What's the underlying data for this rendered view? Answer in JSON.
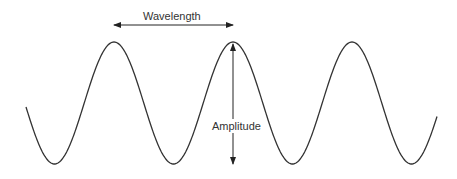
{
  "diagram": {
    "labels": {
      "wavelength": "Wavelength",
      "amplitude": "Amplitude"
    },
    "wave": {
      "start": [
        26,
        107
      ],
      "end": [
        437,
        118
      ],
      "center_y": 103,
      "amplitude_px": 61,
      "period_px": 119,
      "peaks": [
        [
          114,
          43
        ],
        [
          233,
          43
        ],
        [
          353,
          42
        ]
      ],
      "troughs": [
        [
          56,
          165
        ],
        [
          173,
          164
        ],
        [
          294,
          163
        ],
        [
          413,
          163
        ]
      ],
      "stroke": "#333333"
    },
    "wavelength_arrow": {
      "x1": 114,
      "x2": 233,
      "y": 25
    },
    "amplitude_arrow": {
      "x": 233,
      "y1": 44,
      "y2": 164
    }
  }
}
